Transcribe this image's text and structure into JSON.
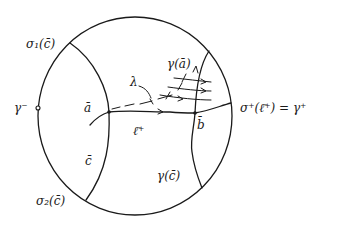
{
  "diagram": {
    "type": "hyperbolic disk sketch",
    "labels": {
      "sigma1_c": "σ₁(c̄)",
      "sigma2_c": "σ₂(c̄)",
      "gamma_minus": "γ⁻",
      "a_bar": "ā",
      "c_bar": "c̄",
      "lambda": "λ",
      "l_plus": "ℓ̄⁺",
      "b_bar": "b̄",
      "gamma_a": "γ(ā)",
      "gamma_c": "γ(c̄)",
      "sigma_plus": "σ⁺(ℓ̄⁺) = γ⁺"
    },
    "colors": {
      "ink": "#1a1a1a",
      "background": "#ffffff"
    }
  }
}
